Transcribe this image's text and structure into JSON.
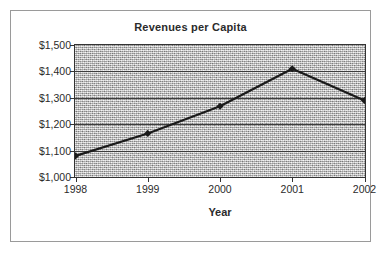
{
  "chart_data": {
    "type": "line",
    "title": "Revenues per Capita",
    "xlabel": "Year",
    "ylabel": "",
    "categories": [
      "1998",
      "1999",
      "2000",
      "2001",
      "2002"
    ],
    "x": [
      1998,
      1999,
      2000,
      2001,
      2002
    ],
    "values": [
      1080,
      1165,
      1268,
      1410,
      1290
    ],
    "series": [
      {
        "name": "Revenues per Capita",
        "values": [
          1080,
          1165,
          1268,
          1410,
          1290
        ]
      }
    ],
    "ylim": [
      1000,
      1500
    ],
    "yticks": [
      1000,
      1100,
      1200,
      1300,
      1400,
      1500
    ],
    "ytick_labels": [
      "$1,000",
      "$1,100",
      "$1,200",
      "$1,300",
      "$1,400",
      "$1,500"
    ],
    "xtick_labels": [
      "1998",
      "1999",
      "2000",
      "2001",
      "2002"
    ],
    "grid": true,
    "grid_axis": "y",
    "legend": false,
    "legend_position": "none",
    "marker": "diamond",
    "line_color": "#1a1a1a",
    "marker_color": "#1a1a1a",
    "plot_background_color": "#c9c9c9",
    "plot_background_style": "speckled-gray-texture",
    "axis_color": "#333333",
    "gridline_color": "#3d3d3d",
    "text_color": "#2b2b2b",
    "border_color": "#9a9a9a"
  }
}
